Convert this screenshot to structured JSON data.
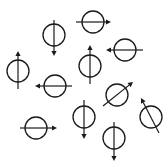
{
  "diagram": {
    "width": 168,
    "height": 167,
    "stroke_color": "#1a1a1a",
    "background": "#ffffff",
    "radius": 11,
    "symbols": [
      {
        "cx": 93,
        "cy": 22,
        "x1": 76,
        "y1": 22,
        "x2": 111,
        "y2": 22,
        "direction": "right"
      },
      {
        "cx": 54,
        "cy": 35,
        "x1": 54,
        "y1": 20,
        "x2": 54,
        "y2": 56,
        "direction": "down"
      },
      {
        "cx": 125,
        "cy": 50,
        "x1": 143,
        "y1": 50,
        "x2": 106,
        "y2": 50,
        "direction": "left"
      },
      {
        "cx": 90,
        "cy": 66,
        "x1": 90,
        "y1": 84,
        "x2": 90,
        "y2": 45,
        "direction": "up"
      },
      {
        "cx": 18,
        "cy": 71,
        "x1": 18,
        "y1": 89,
        "x2": 18,
        "y2": 51,
        "direction": "up"
      },
      {
        "cx": 55,
        "cy": 86,
        "x1": 72,
        "y1": 86,
        "x2": 35,
        "y2": 86,
        "direction": "left"
      },
      {
        "cx": 117,
        "cy": 95,
        "x1": 103,
        "y1": 106,
        "x2": 133,
        "y2": 82,
        "direction": "up-right"
      },
      {
        "cx": 151,
        "cy": 117,
        "x1": 159,
        "y1": 133,
        "x2": 141,
        "y2": 98,
        "direction": "up-left"
      },
      {
        "cx": 84,
        "cy": 117,
        "x1": 84,
        "y1": 100,
        "x2": 84,
        "y2": 139,
        "direction": "down"
      },
      {
        "cx": 36,
        "cy": 128,
        "x1": 20,
        "y1": 128,
        "x2": 57,
        "y2": 128,
        "direction": "right"
      },
      {
        "cx": 114,
        "cy": 138,
        "x1": 114,
        "y1": 122,
        "x2": 114,
        "y2": 161,
        "direction": "down"
      }
    ]
  }
}
